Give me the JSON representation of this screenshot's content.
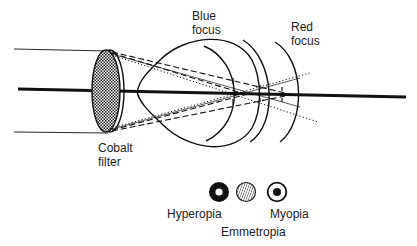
{
  "diagram": {
    "type": "optical-ray-diagram",
    "labels": {
      "blue_focus_line1": "Blue",
      "blue_focus_line2": "focus",
      "red_focus_line1": "Red",
      "red_focus_line2": "focus",
      "cobalt_filter_line1": "Cobalt",
      "cobalt_filter_line2": "filter"
    },
    "legend": [
      {
        "id": "hyperopia",
        "label": "Hyperopia",
        "symbol": "black ring with white center"
      },
      {
        "id": "emmetropia",
        "label": "Emmetropia",
        "symbol": "hatched disc"
      },
      {
        "id": "myopia",
        "label": "Myopia",
        "symbol": "white ring with black dot"
      }
    ],
    "colors": {
      "ink": "#111111",
      "text": "#222222",
      "background": "#ffffff",
      "filter_fill": "#777777"
    }
  }
}
